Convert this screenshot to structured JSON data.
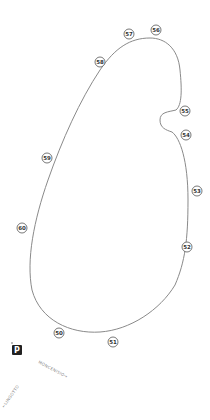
{
  "map": {
    "track_color": "#8a8a8a",
    "markers": [
      {
        "label": "56",
        "x": 156,
        "y": 30
      },
      {
        "label": "57",
        "x": 129,
        "y": 34
      },
      {
        "label": "58",
        "x": 100,
        "y": 62
      },
      {
        "label": "55",
        "x": 185,
        "y": 111
      },
      {
        "label": "54",
        "x": 186,
        "y": 135
      },
      {
        "label": "53",
        "x": 197,
        "y": 191
      },
      {
        "label": "52",
        "x": 187,
        "y": 247
      },
      {
        "label": "51",
        "x": 113,
        "y": 342
      },
      {
        "label": "50",
        "x": 59,
        "y": 333
      },
      {
        "label": "59",
        "x": 47,
        "y": 158
      },
      {
        "label": "60",
        "x": 22,
        "y": 228
      }
    ],
    "parking": {
      "label": "P",
      "x": 17,
      "y": 350
    },
    "road_labels": [
      {
        "text": "MONCENISIO→",
        "x": 38,
        "y": 363,
        "rotate": 28
      },
      {
        "text": "←LINGOTTO",
        "x": 4,
        "y": 408,
        "rotate": -55
      }
    ]
  }
}
